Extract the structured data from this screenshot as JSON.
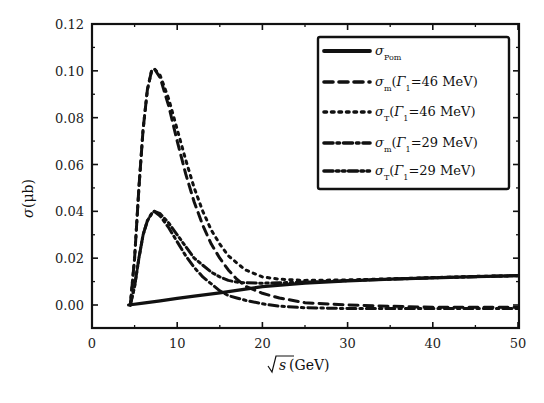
{
  "chart_data": {
    "type": "line",
    "title": "",
    "xlabel": "√s(GeV)",
    "ylabel": "σ(μb)",
    "xlim": [
      0,
      50
    ],
    "ylim": [
      -0.008,
      0.12
    ],
    "x_ticks": [
      "0",
      "10",
      "20",
      "30",
      "40",
      "50"
    ],
    "y_ticks": [
      "0.00",
      "0.02",
      "0.04",
      "0.06",
      "0.08",
      "0.10",
      "0.12"
    ],
    "grid": false,
    "legend_position": "upper right",
    "series": [
      {
        "name": "σ_Pom",
        "style": "solid",
        "x": [
          4.3,
          6,
          8,
          10,
          12,
          15,
          18,
          20,
          25,
          30,
          35,
          40,
          45,
          50
        ],
        "y": [
          0.0,
          0.0008,
          0.0018,
          0.0028,
          0.0038,
          0.0052,
          0.0068,
          0.0078,
          0.0093,
          0.0103,
          0.011,
          0.0116,
          0.0121,
          0.0125
        ]
      },
      {
        "name": "σ_m(Γ1=46 MeV)",
        "style": "dashed",
        "x": [
          4.5,
          5,
          5.5,
          6,
          6.5,
          7,
          7.3,
          8,
          9,
          10,
          11,
          12,
          13,
          14,
          15,
          16,
          17,
          18,
          20,
          22,
          25,
          30,
          35,
          40,
          45,
          50
        ],
        "y": [
          0.0,
          0.02,
          0.05,
          0.075,
          0.092,
          0.1,
          0.101,
          0.097,
          0.085,
          0.07,
          0.056,
          0.044,
          0.034,
          0.026,
          0.02,
          0.015,
          0.011,
          0.008,
          0.005,
          0.003,
          0.001,
          0.0,
          -0.0005,
          -0.001,
          -0.001,
          -0.001
        ]
      },
      {
        "name": "σ_T(Γ1=46 MeV)",
        "style": "dotted",
        "x": [
          4.5,
          5,
          5.5,
          6,
          6.5,
          7,
          7.3,
          8,
          9,
          10,
          11,
          12,
          13,
          14,
          15,
          16,
          17,
          18,
          20,
          22,
          25,
          30,
          35,
          40,
          45,
          50
        ],
        "y": [
          0.0,
          0.02,
          0.05,
          0.075,
          0.092,
          0.1,
          0.101,
          0.098,
          0.088,
          0.075,
          0.062,
          0.05,
          0.04,
          0.032,
          0.026,
          0.021,
          0.018,
          0.015,
          0.012,
          0.011,
          0.0105,
          0.0107,
          0.0112,
          0.0117,
          0.0122,
          0.0125
        ]
      },
      {
        "name": "σ_m(Γ1=29 MeV)",
        "style": "dash-dot",
        "x": [
          4.5,
          5,
          5.5,
          6,
          6.5,
          7,
          7.3,
          8,
          9,
          10,
          11,
          12,
          13,
          14,
          15,
          16,
          17,
          18,
          20,
          22,
          25,
          30,
          35,
          40,
          45,
          50
        ],
        "y": [
          0.0,
          0.008,
          0.02,
          0.03,
          0.036,
          0.039,
          0.04,
          0.038,
          0.033,
          0.027,
          0.021,
          0.016,
          0.012,
          0.009,
          0.006,
          0.004,
          0.003,
          0.002,
          0.0005,
          -0.0005,
          -0.0012,
          -0.0015,
          -0.0015,
          -0.0015,
          -0.0015,
          -0.0015
        ]
      },
      {
        "name": "σ_T(Γ1=29 MeV)",
        "style": "dash-dot-dot",
        "x": [
          4.5,
          5,
          5.5,
          6,
          6.5,
          7,
          7.3,
          8,
          9,
          10,
          11,
          12,
          13,
          14,
          15,
          16,
          17,
          18,
          20,
          22,
          25,
          30,
          35,
          40,
          45,
          50
        ],
        "y": [
          0.0,
          0.008,
          0.02,
          0.03,
          0.036,
          0.039,
          0.04,
          0.039,
          0.035,
          0.03,
          0.025,
          0.02,
          0.017,
          0.014,
          0.012,
          0.0105,
          0.0098,
          0.0095,
          0.0093,
          0.0095,
          0.0098,
          0.0104,
          0.011,
          0.0116,
          0.0121,
          0.0125
        ]
      }
    ]
  },
  "axes": {
    "xlabel_sqrt": "s",
    "xlabel_unit": "(GeV)",
    "ylabel_sigma": "σ",
    "ylabel_unit": "(μb)"
  },
  "legend": {
    "items": [
      {
        "main": "σ",
        "sub": "Pom",
        "paren": ""
      },
      {
        "main": "σ",
        "sub": "m",
        "paren_open": "(",
        "gamma": "Γ",
        "gsub": "1",
        "value": "=46 MeV)"
      },
      {
        "main": "σ",
        "sub": "T",
        "paren_open": "(",
        "gamma": "Γ",
        "gsub": "1",
        "value": "=46 MeV)"
      },
      {
        "main": "σ",
        "sub": "m",
        "paren_open": "(",
        "gamma": "Γ",
        "gsub": "1",
        "value": "=29 MeV)"
      },
      {
        "main": "σ",
        "sub": "T",
        "paren_open": "(",
        "gamma": "Γ",
        "gsub": "1",
        "value": "=29 MeV)"
      }
    ]
  }
}
